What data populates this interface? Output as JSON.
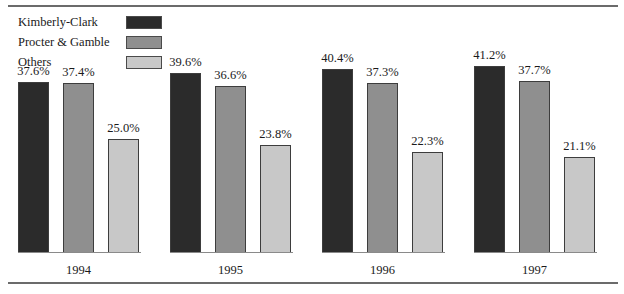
{
  "legend": {
    "items": [
      {
        "label": "Kimberly-Clark",
        "color": "#2b2b2b"
      },
      {
        "label": "Procter & Gamble",
        "color": "#8f8f8f"
      },
      {
        "label": "Others",
        "color": "#c8c8c8"
      }
    ]
  },
  "chart_data": {
    "type": "bar",
    "title": "",
    "xlabel": "",
    "ylabel": "",
    "ylim": [
      0,
      45
    ],
    "grid": false,
    "legend_position": "top-left",
    "categories": [
      "1994",
      "1995",
      "1996",
      "1997"
    ],
    "series": [
      {
        "name": "Kimberly-Clark",
        "color": "#2b2b2b",
        "values": [
          37.6,
          39.6,
          40.4,
          41.2
        ],
        "labels": [
          "37.6%",
          "39.6%",
          "40.4%",
          "41.2%"
        ]
      },
      {
        "name": "Procter & Gamble",
        "color": "#8f8f8f",
        "values": [
          37.4,
          36.6,
          37.3,
          37.7
        ],
        "labels": [
          "37.4%",
          "36.6%",
          "37.3%",
          "37.7%"
        ]
      },
      {
        "name": "Others",
        "color": "#c8c8c8",
        "values": [
          25.0,
          23.8,
          22.3,
          21.1
        ],
        "labels": [
          "25.0%",
          "23.8%",
          "22.3%",
          "21.1%"
        ]
      }
    ]
  }
}
